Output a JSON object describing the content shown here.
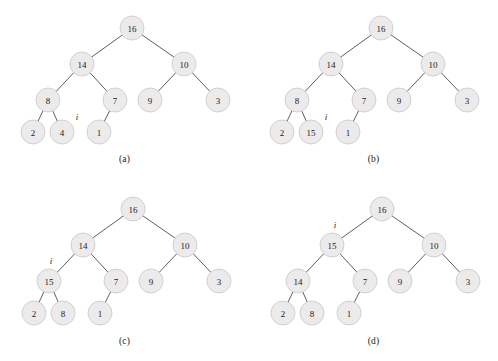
{
  "figure": {
    "type": "diagram",
    "width": 498,
    "height": 361,
    "node_radius": 12,
    "colors": {
      "node_fill": "#eceaea",
      "node_stroke": "#c9c6c6",
      "edge": "#4d4d4d",
      "text": "#1b1b1b",
      "background": "#ffffff"
    }
  },
  "panels": [
    {
      "id": "a",
      "caption": "(a)",
      "caption_x": 124,
      "caption_y": 154,
      "origin_x": 0,
      "origin_y": 0,
      "nodes": [
        {
          "name": "root",
          "label": "16",
          "x": 132,
          "y": 28
        },
        {
          "name": "left",
          "label": "14",
          "x": 82,
          "y": 64
        },
        {
          "name": "right",
          "label": "10",
          "x": 184,
          "y": 64
        },
        {
          "name": "left-left",
          "label": "8",
          "x": 48,
          "y": 100
        },
        {
          "name": "left-right",
          "label": "7",
          "x": 115,
          "y": 100
        },
        {
          "name": "right-left",
          "label": "9",
          "x": 150,
          "y": 100
        },
        {
          "name": "right-right",
          "label": "3",
          "x": 218,
          "y": 100
        },
        {
          "name": "leaf-1",
          "label": "2",
          "x": 33,
          "y": 132
        },
        {
          "name": "leaf-2",
          "label": "4",
          "x": 62,
          "y": 132
        },
        {
          "name": "leaf-3",
          "label": "1",
          "x": 99,
          "y": 132
        }
      ],
      "edges": [
        [
          "root",
          "left"
        ],
        [
          "root",
          "right"
        ],
        [
          "left",
          "left-left"
        ],
        [
          "left",
          "left-right"
        ],
        [
          "right",
          "right-left"
        ],
        [
          "right",
          "right-right"
        ],
        [
          "left-left",
          "leaf-1"
        ],
        [
          "left-left",
          "leaf-2"
        ],
        [
          "left-right",
          "leaf-3"
        ]
      ],
      "marker": {
        "label": "i",
        "x": 77,
        "y": 117
      }
    },
    {
      "id": "b",
      "caption": "(b)",
      "caption_x": 124,
      "caption_y": 154,
      "origin_x": 249,
      "origin_y": 0,
      "nodes": [
        {
          "name": "root",
          "label": "16",
          "x": 132,
          "y": 28
        },
        {
          "name": "left",
          "label": "14",
          "x": 82,
          "y": 64
        },
        {
          "name": "right",
          "label": "10",
          "x": 184,
          "y": 64
        },
        {
          "name": "left-left",
          "label": "8",
          "x": 48,
          "y": 100
        },
        {
          "name": "left-right",
          "label": "7",
          "x": 115,
          "y": 100
        },
        {
          "name": "right-left",
          "label": "9",
          "x": 150,
          "y": 100
        },
        {
          "name": "right-right",
          "label": "3",
          "x": 218,
          "y": 100
        },
        {
          "name": "leaf-1",
          "label": "2",
          "x": 33,
          "y": 132
        },
        {
          "name": "leaf-2",
          "label": "15",
          "x": 62,
          "y": 132
        },
        {
          "name": "leaf-3",
          "label": "1",
          "x": 99,
          "y": 132
        }
      ],
      "edges": [
        [
          "root",
          "left"
        ],
        [
          "root",
          "right"
        ],
        [
          "left",
          "left-left"
        ],
        [
          "left",
          "left-right"
        ],
        [
          "right",
          "right-left"
        ],
        [
          "right",
          "right-right"
        ],
        [
          "left-left",
          "leaf-1"
        ],
        [
          "left-left",
          "leaf-2"
        ],
        [
          "left-right",
          "leaf-3"
        ]
      ],
      "marker": {
        "label": "i",
        "x": 77,
        "y": 117
      }
    },
    {
      "id": "c",
      "caption": "(c)",
      "caption_x": 124,
      "caption_y": 155,
      "origin_x": 0,
      "origin_y": 181,
      "nodes": [
        {
          "name": "root",
          "label": "16",
          "x": 133,
          "y": 28
        },
        {
          "name": "left",
          "label": "14",
          "x": 83,
          "y": 64
        },
        {
          "name": "right",
          "label": "10",
          "x": 185,
          "y": 64
        },
        {
          "name": "left-left",
          "label": "15",
          "x": 49,
          "y": 100
        },
        {
          "name": "left-right",
          "label": "7",
          "x": 116,
          "y": 100
        },
        {
          "name": "right-left",
          "label": "9",
          "x": 151,
          "y": 100
        },
        {
          "name": "right-right",
          "label": "3",
          "x": 219,
          "y": 100
        },
        {
          "name": "leaf-1",
          "label": "2",
          "x": 34,
          "y": 132
        },
        {
          "name": "leaf-2",
          "label": "8",
          "x": 63,
          "y": 132
        },
        {
          "name": "leaf-3",
          "label": "1",
          "x": 100,
          "y": 132
        }
      ],
      "edges": [
        [
          "root",
          "left"
        ],
        [
          "root",
          "right"
        ],
        [
          "left",
          "left-left"
        ],
        [
          "left",
          "left-right"
        ],
        [
          "right",
          "right-left"
        ],
        [
          "right",
          "right-right"
        ],
        [
          "left-left",
          "leaf-1"
        ],
        [
          "left-left",
          "leaf-2"
        ],
        [
          "left-right",
          "leaf-3"
        ]
      ],
      "marker": {
        "label": "i",
        "x": 51,
        "y": 80
      }
    },
    {
      "id": "d",
      "caption": "(d)",
      "caption_x": 124,
      "caption_y": 155,
      "origin_x": 249,
      "origin_y": 181,
      "nodes": [
        {
          "name": "root",
          "label": "16",
          "x": 133,
          "y": 28
        },
        {
          "name": "left",
          "label": "15",
          "x": 83,
          "y": 64
        },
        {
          "name": "right",
          "label": "10",
          "x": 185,
          "y": 64
        },
        {
          "name": "left-left",
          "label": "14",
          "x": 49,
          "y": 100
        },
        {
          "name": "left-right",
          "label": "7",
          "x": 116,
          "y": 100
        },
        {
          "name": "right-left",
          "label": "9",
          "x": 151,
          "y": 100
        },
        {
          "name": "right-right",
          "label": "3",
          "x": 219,
          "y": 100
        },
        {
          "name": "leaf-1",
          "label": "2",
          "x": 34,
          "y": 132
        },
        {
          "name": "leaf-2",
          "label": "8",
          "x": 63,
          "y": 132
        },
        {
          "name": "leaf-3",
          "label": "1",
          "x": 100,
          "y": 132
        }
      ],
      "edges": [
        [
          "root",
          "left"
        ],
        [
          "root",
          "right"
        ],
        [
          "left",
          "left-left"
        ],
        [
          "left",
          "left-right"
        ],
        [
          "right",
          "right-left"
        ],
        [
          "right",
          "right-right"
        ],
        [
          "left-left",
          "leaf-1"
        ],
        [
          "left-left",
          "leaf-2"
        ],
        [
          "left-right",
          "leaf-3"
        ]
      ],
      "marker": {
        "label": "i",
        "x": 86,
        "y": 44
      }
    }
  ]
}
